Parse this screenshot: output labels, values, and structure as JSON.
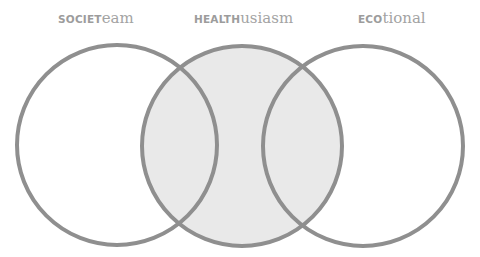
{
  "diagram": {
    "type": "venn",
    "sets": [
      {
        "id": "society",
        "label_caps": "SOCIET",
        "label_rest": "eam",
        "highlighted": false
      },
      {
        "id": "health",
        "label_caps": "HEALTH",
        "label_rest": "usiasm",
        "highlighted": true
      },
      {
        "id": "eco",
        "label_caps": "ECO",
        "label_rest": "tional",
        "highlighted": false
      }
    ],
    "colors": {
      "stroke": "#8f8f8f",
      "highlight_fill": "#e9e9e9",
      "background": "#ffffff",
      "label_text": "#9a9a9a"
    }
  }
}
